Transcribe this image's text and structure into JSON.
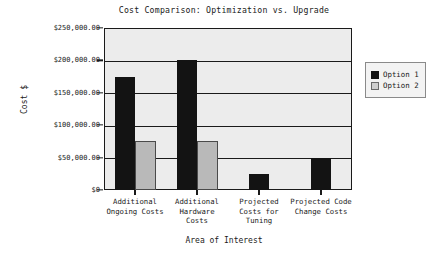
{
  "chart_data": {
    "type": "bar",
    "title": "Cost Comparison: Optimization vs. Upgrade",
    "xlabel": "Area of Interest",
    "ylabel": "Cost $",
    "categories": [
      "Additional Ongoing Costs",
      "Additional Hardware Costs",
      "Projected Costs for Tuning",
      "Projected Code Change Costs"
    ],
    "category_lines": [
      [
        "Additional",
        "Ongoing Costs"
      ],
      [
        "Additional",
        "Hardware",
        "Costs"
      ],
      [
        "Projected",
        "Costs for",
        "Tuning"
      ],
      [
        "Projected Code",
        "Change Costs"
      ]
    ],
    "series": [
      {
        "name": "Option 1",
        "color": "#131313",
        "values": [
          175000,
          200000,
          25000,
          50000
        ]
      },
      {
        "name": "Option 2",
        "color": "#b9b9b9",
        "values": [
          75000,
          75000,
          0,
          0
        ]
      }
    ],
    "ylim": [
      0,
      250000
    ],
    "ytick_values": [
      0,
      50000,
      100000,
      150000,
      200000,
      250000
    ],
    "ytick_labels": [
      "$0",
      "$50,000.00",
      "$100,000.00",
      "$150,000.00",
      "$200,000.00",
      "$250,000.00"
    ],
    "grid": true,
    "legend_position": "right",
    "legend_entries": [
      "Option 1",
      "Option 2"
    ],
    "plot_background": "#ececec",
    "axis_color": "#1a1a1a"
  }
}
